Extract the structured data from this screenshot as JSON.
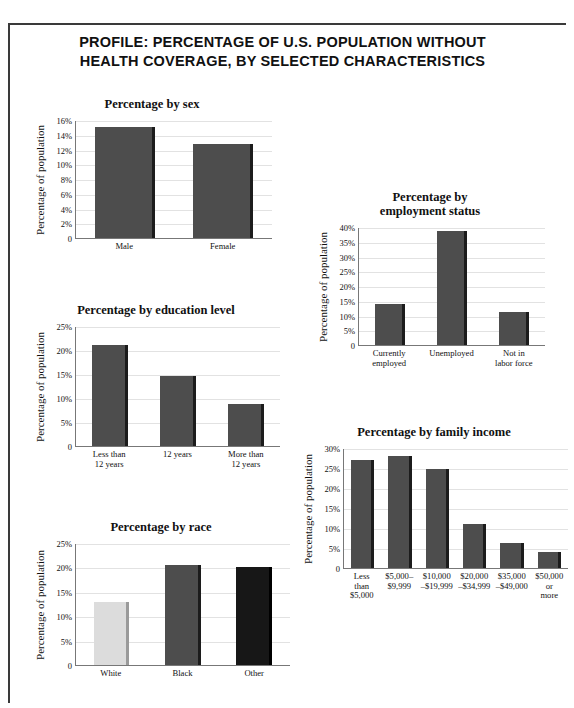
{
  "document": {
    "title_line1": "PROFILE: PERCENTAGE OF U.S. POPULATION WITHOUT",
    "title_line2": "HEALTH COVERAGE, BY SELECTED CHARACTERISTICS",
    "bar_color": "#4d4d4d",
    "bar_color_light": "#dcdcdc",
    "bar_color_dark": "#171717"
  },
  "chart_data": [
    {
      "id": "sex",
      "type": "bar",
      "title": "Percentage by sex",
      "title_lines": [
        "Percentage by sex"
      ],
      "xlabel": "",
      "ylabel": "Percentage of population",
      "categories": [
        "Male",
        "Female"
      ],
      "category_lines": [
        [
          "Male"
        ],
        [
          "Female"
        ]
      ],
      "values": [
        15.1,
        12.8
      ],
      "ylim": [
        0,
        16
      ],
      "yticks": [
        0,
        2,
        4,
        6,
        8,
        10,
        12,
        14,
        16
      ],
      "yticklabels": [
        "0",
        "2%",
        "4%",
        "6%",
        "8%",
        "10%",
        "12%",
        "14%",
        "16%"
      ],
      "grid": true,
      "legend": "none"
    },
    {
      "id": "education",
      "type": "bar",
      "title": "Percentage by education level",
      "title_lines": [
        "Percentage by education level"
      ],
      "xlabel": "",
      "ylabel": "Percentage of population",
      "categories": [
        "Less than 12 years",
        "12 years",
        "More than 12 years"
      ],
      "category_lines": [
        [
          "Less than",
          "12 years"
        ],
        [
          "12 years"
        ],
        [
          "More than",
          "12 years"
        ]
      ],
      "values": [
        21.0,
        14.5,
        8.7
      ],
      "ylim": [
        0,
        25
      ],
      "yticks": [
        0,
        5,
        10,
        15,
        20,
        25
      ],
      "yticklabels": [
        "0",
        "5%",
        "10%",
        "15%",
        "20%",
        "25%"
      ],
      "grid": true,
      "legend": "none"
    },
    {
      "id": "race",
      "type": "bar",
      "title": "Percentage by race",
      "title_lines": [
        "Percentage by race"
      ],
      "xlabel": "",
      "ylabel": "Percentage of population",
      "categories": [
        "White",
        "Black",
        "Other"
      ],
      "category_lines": [
        [
          "White"
        ],
        [
          "Black"
        ],
        [
          "Other"
        ]
      ],
      "values": [
        13.0,
        20.5,
        20.1
      ],
      "bar_styles": [
        "light",
        "",
        "dark"
      ],
      "ylim": [
        0,
        25
      ],
      "yticks": [
        0,
        5,
        10,
        15,
        20,
        25
      ],
      "yticklabels": [
        "0",
        "5%",
        "10%",
        "15%",
        "20%",
        "25%"
      ],
      "grid": true,
      "legend": "none"
    },
    {
      "id": "employment",
      "type": "bar",
      "title": "Percentage by employment status",
      "title_lines": [
        "Percentage by",
        "employment status"
      ],
      "xlabel": "",
      "ylabel": "Percentage of population",
      "categories": [
        "Currently employed",
        "Unemployed",
        "Not in labor force"
      ],
      "category_lines": [
        [
          "Currently",
          "employed"
        ],
        [
          "Unemployed"
        ],
        [
          "Not in",
          "labor force"
        ]
      ],
      "values": [
        14.0,
        38.5,
        11.2
      ],
      "ylim": [
        0,
        40
      ],
      "yticks": [
        0,
        5,
        10,
        15,
        20,
        25,
        30,
        35,
        40
      ],
      "yticklabels": [
        "0",
        "5%",
        "10%",
        "15%",
        "20%",
        "25%",
        "30%",
        "35%",
        "40%"
      ],
      "grid": true,
      "legend": "none"
    },
    {
      "id": "income",
      "type": "bar",
      "title": "Percentage by family income",
      "title_lines": [
        "Percentage by family income"
      ],
      "xlabel": "",
      "ylabel": "Percentage of population",
      "categories": [
        "Less than $5,000",
        "$5,000–$9,999",
        "$10,000–$19,999",
        "$20,000–$34,999",
        "$35,000–$49,000",
        "$50,000 or more"
      ],
      "category_lines": [
        [
          "Less",
          "than",
          "$5,000"
        ],
        [
          "$5,000–",
          "$9,999"
        ],
        [
          "$10,000",
          "–$19,999"
        ],
        [
          "$20,000",
          "–$34,999"
        ],
        [
          "$35,000",
          "–$49,000"
        ],
        [
          "$50,000",
          "or",
          "more"
        ]
      ],
      "values": [
        27.0,
        28.0,
        24.7,
        11.0,
        6.3,
        4.0
      ],
      "ylim": [
        0,
        30
      ],
      "yticks": [
        0,
        5,
        10,
        15,
        20,
        25,
        30
      ],
      "yticklabels": [
        "0",
        "5%",
        "10%",
        "15%",
        "20%",
        "25%",
        "30%"
      ],
      "grid": true,
      "legend": "none"
    }
  ]
}
